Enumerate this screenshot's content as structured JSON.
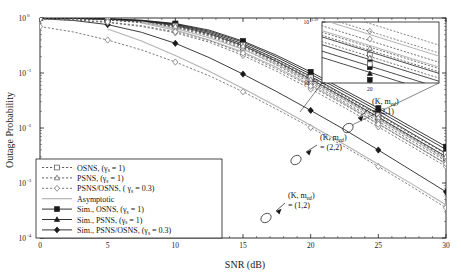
{
  "chart_data": {
    "type": "line",
    "title": "",
    "xlabel": "SNR (dB)",
    "ylabel": "Outage Probability",
    "xlim": [
      0,
      30
    ],
    "ylim_log10": [
      -4,
      0
    ],
    "xticks": [
      "0",
      "5",
      "10",
      "15",
      "20",
      "25",
      "30"
    ],
    "yticks": [
      "10",
      "10",
      "10",
      "10",
      "10"
    ],
    "ytick_exponents": [
      "0",
      "-1",
      "-2",
      "-3",
      "-4"
    ],
    "grid": false,
    "legend_position": "lower-left",
    "legend": [
      {
        "label": "OSNS, (γ",
        "sub": "s",
        "tail": " = 1)",
        "style": "dashed",
        "marker": "square",
        "color": "#4d4d4d"
      },
      {
        "label": "PSNS, (γ",
        "sub": "s",
        "tail": " = 1)",
        "style": "dashed",
        "marker": "triangle",
        "color": "#4d4d4d"
      },
      {
        "label": "PSNS/OSNS, ( γ",
        "sub": "s",
        "tail": " = 0.3)",
        "style": "dashed",
        "marker": "diamond",
        "color": "#666666"
      },
      {
        "label": "Asymptotic",
        "sub": "",
        "tail": "",
        "style": "solid",
        "marker": "none",
        "color": "#b3b3b3"
      },
      {
        "label": "Sim., OSNS, (γ",
        "sub": "s",
        "tail": " = 1)",
        "style": "solid",
        "marker": "square",
        "color": "#1a1a1a"
      },
      {
        "label": "Sim., PSNS, (γ",
        "sub": "s",
        "tail": " = 1)",
        "style": "solid",
        "marker": "triangle",
        "color": "#1a1a1a"
      },
      {
        "label": "Sim., PSNS/OSNS, (γ",
        "sub": "s",
        "tail": " = 0.3)",
        "style": "solid",
        "marker": "diamond",
        "color": "#1a1a1a"
      }
    ],
    "annotations": [
      {
        "name": "k-med-2-1",
        "line1": "(K, m",
        "sub": "ed",
        "line1b": ")",
        "line2": "= (2,1)"
      },
      {
        "name": "k-med-2-2",
        "line1": "(K, m",
        "sub": "ed",
        "line1b": ")",
        "line2": "= (2,2)"
      },
      {
        "name": "k-med-1-2",
        "line1": "(K, m",
        "sub": "ed",
        "line1b": ")",
        "line2": "= (1,2)"
      }
    ],
    "inset": {
      "xticks": [
        "20"
      ],
      "ytick_hi": "10",
      "ytick_hi_sup": "-1.39",
      "ytick_lo": "10",
      "ytick_lo_sup": "-1.41"
    },
    "series": [
      {
        "name": "sim-psns-osns-1-2",
        "group": "(1,2)",
        "style": "solid",
        "marker": "diamond",
        "color": "#1a1a1a",
        "x": [
          0,
          2.5,
          5,
          7.5,
          10,
          12.5,
          15,
          17.5,
          20,
          22.5,
          25,
          27.5,
          30
        ],
        "y_log10": [
          -0.012,
          -0.045,
          -0.12,
          -0.26,
          -0.46,
          -0.72,
          -1.02,
          -1.34,
          -1.68,
          -2.03,
          -2.4,
          -2.78,
          -3.16
        ]
      },
      {
        "name": "psns-osns-0p3-1-2",
        "group": "(1,2)",
        "style": "dashed",
        "marker": "diamond",
        "color": "#666666",
        "x": [
          0,
          2.5,
          5,
          7.5,
          10,
          12.5,
          15,
          17.5,
          20,
          22.5,
          25,
          27.5,
          30
        ],
        "y_log10": [
          -0.155,
          -0.255,
          -0.4,
          -0.58,
          -0.8,
          -1.05,
          -1.34,
          -1.66,
          -1.99,
          -2.34,
          -2.7,
          -3.07,
          -3.45
        ]
      },
      {
        "name": "asymptotic-1-2",
        "group": "(1,2)",
        "style": "solid",
        "marker": "none",
        "color": "#b3b3b3",
        "x": [
          5,
          7.5,
          10,
          12.5,
          15,
          17.5,
          20,
          22.5,
          25,
          27.5,
          30
        ],
        "y_log10": [
          -0.2,
          -0.42,
          -0.68,
          -0.97,
          -1.28,
          -1.61,
          -1.95,
          -2.3,
          -2.66,
          -3.02,
          -3.4
        ]
      },
      {
        "name": "sim-osns-2-2",
        "group": "(2,2)",
        "style": "solid",
        "marker": "square",
        "color": "#1a1a1a",
        "x": [
          0,
          2.5,
          5,
          7.5,
          10,
          12.5,
          15,
          17.5,
          20,
          22.5,
          25,
          27.5,
          30
        ],
        "y_log10": [
          -0.002,
          -0.006,
          -0.018,
          -0.05,
          -0.12,
          -0.26,
          -0.47,
          -0.75,
          -1.06,
          -1.4,
          -1.74,
          -2.1,
          -2.46
        ]
      },
      {
        "name": "sim-psns-2-2",
        "group": "(2,2)",
        "style": "solid",
        "marker": "triangle",
        "color": "#1a1a1a",
        "x": [
          0,
          2.5,
          5,
          7.5,
          10,
          12.5,
          15,
          17.5,
          20,
          22.5,
          25,
          27.5,
          30
        ],
        "y_log10": [
          -0.003,
          -0.008,
          -0.022,
          -0.058,
          -0.135,
          -0.285,
          -0.5,
          -0.79,
          -1.11,
          -1.45,
          -1.8,
          -2.16,
          -2.52
        ]
      },
      {
        "name": "osns-2-2",
        "group": "(2,2)",
        "style": "dashed",
        "marker": "square",
        "color": "#4d4d4d",
        "x": [
          0,
          2.5,
          5,
          7.5,
          10,
          12.5,
          15,
          17.5,
          20,
          22.5,
          25,
          27.5,
          30
        ],
        "y_log10": [
          -0.004,
          -0.012,
          -0.032,
          -0.075,
          -0.16,
          -0.31,
          -0.53,
          -0.82,
          -1.14,
          -1.48,
          -1.83,
          -2.19,
          -2.55
        ]
      },
      {
        "name": "psns-2-2",
        "group": "(2,2)",
        "style": "dashed",
        "marker": "triangle",
        "color": "#4d4d4d",
        "x": [
          0,
          2.5,
          5,
          7.5,
          10,
          12.5,
          15,
          17.5,
          20,
          22.5,
          25,
          27.5,
          30
        ],
        "y_log10": [
          -0.005,
          -0.015,
          -0.038,
          -0.085,
          -0.175,
          -0.33,
          -0.56,
          -0.86,
          -1.18,
          -1.53,
          -1.88,
          -2.24,
          -2.6
        ]
      },
      {
        "name": "psns-osns-0p3-2-2",
        "group": "(2,2)",
        "style": "dashed",
        "marker": "diamond",
        "color": "#666666",
        "x": [
          0,
          2.5,
          5,
          7.5,
          10,
          12.5,
          15,
          17.5,
          20,
          22.5,
          25,
          27.5,
          30
        ],
        "y_log10": [
          -0.02,
          -0.04,
          -0.082,
          -0.155,
          -0.27,
          -0.44,
          -0.68,
          -0.97,
          -1.29,
          -1.63,
          -1.98,
          -2.34,
          -2.7
        ]
      },
      {
        "name": "asymptotic-2-2",
        "group": "(2,2)",
        "style": "solid",
        "marker": "none",
        "color": "#b3b3b3",
        "x": [
          7.5,
          10,
          12.5,
          15,
          17.5,
          20,
          22.5,
          25,
          27.5,
          30
        ],
        "y_log10": [
          -0.09,
          -0.22,
          -0.4,
          -0.62,
          -0.9,
          -1.22,
          -1.56,
          -1.92,
          -2.28,
          -2.65
        ]
      },
      {
        "name": "sim-osns-2-1",
        "group": "(2,1)",
        "style": "solid",
        "marker": "square",
        "color": "#1a1a1a",
        "x": [
          0,
          2.5,
          5,
          7.5,
          10,
          12.5,
          15,
          17.5,
          20,
          22.5,
          25,
          27.5,
          30
        ],
        "y_log10": [
          -0.0015,
          -0.005,
          -0.014,
          -0.04,
          -0.1,
          -0.22,
          -0.42,
          -0.68,
          -0.98,
          -1.31,
          -1.64,
          -1.99,
          -2.34
        ]
      },
      {
        "name": "sim-psns-2-1",
        "group": "(2,1)",
        "style": "solid",
        "marker": "triangle",
        "color": "#1a1a1a",
        "x": [
          0,
          2.5,
          5,
          7.5,
          10,
          12.5,
          15,
          17.5,
          20,
          22.5,
          25,
          27.5,
          30
        ],
        "y_log10": [
          -0.002,
          -0.006,
          -0.017,
          -0.046,
          -0.11,
          -0.24,
          -0.44,
          -0.71,
          -1.02,
          -1.35,
          -1.69,
          -2.04,
          -2.39
        ]
      },
      {
        "name": "osns-2-1",
        "group": "(2,1)",
        "style": "dashed",
        "marker": "square",
        "color": "#4d4d4d",
        "x": [
          0,
          2.5,
          5,
          7.5,
          10,
          12.5,
          15,
          17.5,
          20,
          22.5,
          25,
          27.5,
          30
        ],
        "y_log10": [
          -0.003,
          -0.009,
          -0.026,
          -0.065,
          -0.14,
          -0.28,
          -0.49,
          -0.77,
          -1.08,
          -1.42,
          -1.76,
          -2.12,
          -2.47
        ]
      },
      {
        "name": "psns-2-1",
        "group": "(2,1)",
        "style": "dashed",
        "marker": "triangle",
        "color": "#4d4d4d",
        "x": [
          0,
          2.5,
          5,
          7.5,
          10,
          12.5,
          15,
          17.5,
          20,
          22.5,
          25,
          27.5,
          30
        ],
        "y_log10": [
          -0.004,
          -0.011,
          -0.03,
          -0.072,
          -0.15,
          -0.3,
          -0.51,
          -0.8,
          -1.12,
          -1.46,
          -1.81,
          -2.17,
          -2.52
        ]
      },
      {
        "name": "psns-osns-0p3-2-1",
        "group": "(2,1)",
        "style": "dashed",
        "marker": "diamond",
        "color": "#666666",
        "x": [
          0,
          2.5,
          5,
          7.5,
          10,
          12.5,
          15,
          17.5,
          20,
          22.5,
          25,
          27.5,
          30
        ],
        "y_log10": [
          -0.016,
          -0.034,
          -0.072,
          -0.14,
          -0.25,
          -0.41,
          -0.64,
          -0.93,
          -1.24,
          -1.58,
          -1.93,
          -2.29,
          -2.65
        ]
      },
      {
        "name": "asymptotic-2-1",
        "group": "(2,1)",
        "style": "solid",
        "marker": "none",
        "color": "#b3b3b3",
        "x": [
          7.5,
          10,
          12.5,
          15,
          17.5,
          20,
          22.5,
          25,
          27.5,
          30
        ],
        "y_log10": [
          -0.07,
          -0.19,
          -0.36,
          -0.57,
          -0.84,
          -1.15,
          -1.49,
          -1.84,
          -2.2,
          -2.57
        ]
      }
    ]
  }
}
